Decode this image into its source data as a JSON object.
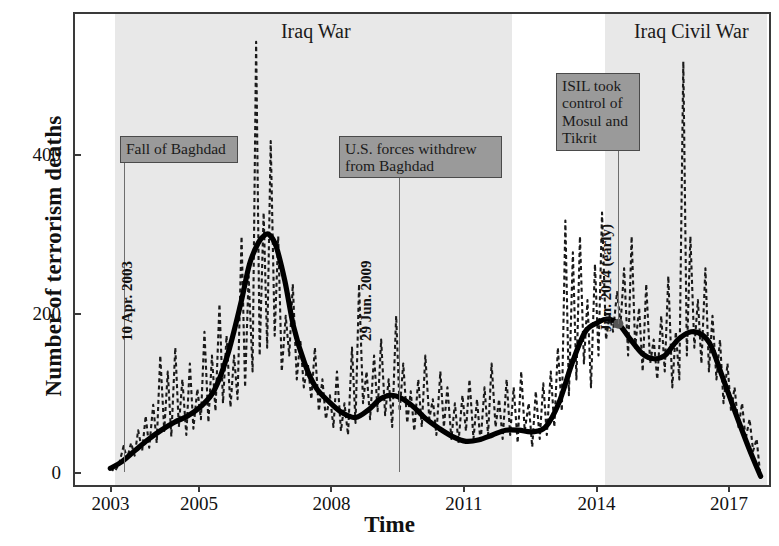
{
  "axes": {
    "ylabel": "Number of terrorism deaths",
    "xlabel": "Time",
    "yticks": [
      {
        "value": 0,
        "label": "0"
      },
      {
        "value": 200,
        "label": "200"
      },
      {
        "value": 400,
        "label": "400"
      }
    ],
    "xticks": [
      {
        "value": 2003,
        "label": "2003"
      },
      {
        "value": 2005,
        "label": "2005"
      },
      {
        "value": 2008,
        "label": "2008"
      },
      {
        "value": 2011,
        "label": "2011"
      },
      {
        "value": 2014,
        "label": "2014"
      },
      {
        "value": 2017,
        "label": "2017"
      }
    ],
    "xlim": [
      2002.15,
      2017.95
    ],
    "ylim": [
      -18,
      580
    ],
    "grid": false
  },
  "bands": [
    {
      "name": "Iraq War",
      "label": "Iraq War",
      "x_start": 2003.05,
      "x_end": 2012.05,
      "color": "#e8e8e8",
      "title_x": 2007.6
    },
    {
      "name": "Iraq Civil War",
      "label": "Iraq Civil War",
      "x_start": 2014.15,
      "x_end": 2017.82,
      "color": "#e8e8e8",
      "title_x": 2016.1
    }
  ],
  "annotations": [
    {
      "name": "fall-of-baghdad",
      "text": "Fall of Baghdad",
      "date_label": "10 Apr. 2003",
      "x": 2003.27,
      "box_left_px": 118,
      "box_top_px": 134,
      "box_width_px": 118,
      "box_height_px": 27,
      "stem_top_px": 161,
      "stem_bottom_px": 470,
      "date_x_px": 134,
      "date_y_px": 322
    },
    {
      "name": "us-forces-withdrew",
      "text": "U.S. forces withdrew\nfrom Baghdad",
      "date_label": "29 Jun. 2009",
      "x": 2009.49,
      "box_left_px": 337,
      "box_top_px": 134,
      "box_width_px": 163,
      "box_height_px": 42,
      "stem_top_px": 176,
      "stem_bottom_px": 470,
      "date_x_px": 373,
      "date_y_px": 322
    },
    {
      "name": "isil-took-control",
      "text": "ISIL took\ncontrol of\nMosul and\nTikrit",
      "date_label": "Jun. 2014 (early)",
      "x": 2014.45,
      "box_left_px": 554,
      "box_top_px": 71,
      "box_width_px": 84,
      "box_height_px": 78,
      "stem_top_px": 149,
      "stem_bottom_px": 322,
      "date_x_px": 613,
      "date_y_px": 313
    }
  ],
  "marker": {
    "name": "trend-highlight-point",
    "x": 2014.45,
    "y": 190,
    "color": "#555555"
  },
  "chart_data": {
    "type": "line",
    "title": "",
    "xlabel": "Time",
    "ylabel": "Number of terrorism deaths",
    "xlim": [
      2002.15,
      2017.95
    ],
    "ylim": [
      -18,
      580
    ],
    "grid": false,
    "legend": "none",
    "series": [
      {
        "name": "Monthly terrorism deaths (raw)",
        "style": "dashed",
        "color": "#1a1a1a",
        "x": [
          2002.95,
          2003.05,
          2003.15,
          2003.25,
          2003.33,
          2003.42,
          2003.5,
          2003.58,
          2003.67,
          2003.75,
          2003.83,
          2003.92,
          2004.0,
          2004.08,
          2004.17,
          2004.25,
          2004.33,
          2004.42,
          2004.5,
          2004.58,
          2004.67,
          2004.75,
          2004.83,
          2004.92,
          2005.0,
          2005.08,
          2005.17,
          2005.25,
          2005.33,
          2005.42,
          2005.5,
          2005.58,
          2005.67,
          2005.75,
          2005.83,
          2005.92,
          2006.0,
          2006.08,
          2006.17,
          2006.25,
          2006.33,
          2006.42,
          2006.5,
          2006.58,
          2006.67,
          2006.75,
          2006.83,
          2006.92,
          2007.0,
          2007.08,
          2007.17,
          2007.25,
          2007.33,
          2007.42,
          2007.5,
          2007.58,
          2007.67,
          2007.75,
          2007.83,
          2007.92,
          2008.0,
          2008.08,
          2008.17,
          2008.25,
          2008.33,
          2008.42,
          2008.5,
          2008.58,
          2008.67,
          2008.75,
          2008.83,
          2008.92,
          2009.0,
          2009.08,
          2009.17,
          2009.25,
          2009.33,
          2009.42,
          2009.5,
          2009.58,
          2009.67,
          2009.75,
          2009.83,
          2009.92,
          2010.0,
          2010.08,
          2010.17,
          2010.25,
          2010.33,
          2010.42,
          2010.5,
          2010.58,
          2010.67,
          2010.75,
          2010.83,
          2010.92,
          2011.0,
          2011.08,
          2011.17,
          2011.25,
          2011.33,
          2011.42,
          2011.5,
          2011.58,
          2011.67,
          2011.75,
          2011.83,
          2011.92,
          2012.0,
          2012.08,
          2012.17,
          2012.25,
          2012.33,
          2012.42,
          2012.5,
          2012.58,
          2012.67,
          2012.75,
          2012.83,
          2012.92,
          2013.0,
          2013.08,
          2013.17,
          2013.25,
          2013.33,
          2013.42,
          2013.5,
          2013.58,
          2013.67,
          2013.75,
          2013.83,
          2013.92,
          2014.0,
          2014.08,
          2014.17,
          2014.25,
          2014.33,
          2014.42,
          2014.5,
          2014.58,
          2014.67,
          2014.75,
          2014.83,
          2014.92,
          2015.0,
          2015.08,
          2015.17,
          2015.25,
          2015.33,
          2015.42,
          2015.5,
          2015.58,
          2015.67,
          2015.75,
          2015.83,
          2015.92,
          2016.0,
          2016.08,
          2016.17,
          2016.25,
          2016.33,
          2016.42,
          2016.5,
          2016.58,
          2016.67,
          2016.75,
          2016.83,
          2016.92,
          2017.0,
          2017.08,
          2017.17,
          2017.25,
          2017.33,
          2017.42,
          2017.5,
          2017.58,
          2017.67
        ],
        "y": [
          8,
          4,
          14,
          36,
          20,
          40,
          24,
          56,
          30,
          74,
          34,
          88,
          40,
          150,
          55,
          130,
          48,
          160,
          60,
          120,
          50,
          140,
          58,
          108,
          70,
          180,
          66,
          150,
          80,
          215,
          90,
          175,
          85,
          150,
          95,
          300,
          110,
          250,
          130,
          545,
          150,
          330,
          160,
          420,
          175,
          300,
          130,
          200,
          150,
          240,
          120,
          170,
          110,
          140,
          95,
          160,
          80,
          120,
          70,
          100,
          60,
          130,
          55,
          90,
          50,
          160,
          65,
          240,
          90,
          130,
          70,
          150,
          80,
          170,
          75,
          120,
          60,
          200,
          80,
          140,
          65,
          105,
          55,
          120,
          60,
          150,
          70,
          95,
          50,
          130,
          60,
          110,
          45,
          90,
          40,
          100,
          55,
          120,
          45,
          95,
          40,
          110,
          50,
          140,
          60,
          95,
          45,
          120,
          50,
          110,
          40,
          130,
          55,
          90,
          35,
          105,
          45,
          115,
          50,
          130,
          60,
          160,
          80,
          320,
          100,
          280,
          120,
          300,
          140,
          220,
          110,
          265,
          150,
          330,
          170,
          200,
          180,
          230,
          190,
          260,
          150,
          300,
          160,
          210,
          130,
          240,
          140,
          170,
          120,
          200,
          130,
          250,
          110,
          180,
          120,
          520,
          150,
          300,
          160,
          220,
          140,
          260,
          130,
          200,
          120,
          170,
          90,
          140,
          80,
          110,
          60,
          90,
          45,
          70,
          30,
          45,
          -5
        ]
      },
      {
        "name": "Smoothed trend",
        "style": "solid",
        "color": "#000000",
        "x": [
          2002.95,
          2003.2,
          2003.5,
          2003.8,
          2004.1,
          2004.4,
          2004.7,
          2005.0,
          2005.3,
          2005.6,
          2005.9,
          2006.1,
          2006.3,
          2006.45,
          2006.55,
          2006.7,
          2006.9,
          2007.1,
          2007.35,
          2007.6,
          2007.9,
          2008.2,
          2008.5,
          2008.8,
          2009.05,
          2009.3,
          2009.55,
          2009.8,
          2010.1,
          2010.4,
          2010.7,
          2011.0,
          2011.3,
          2011.6,
          2011.9,
          2012.2,
          2012.5,
          2012.8,
          2013.1,
          2013.4,
          2013.7,
          2014.0,
          2014.2,
          2014.45,
          2014.7,
          2015.0,
          2015.25,
          2015.5,
          2015.8,
          2016.1,
          2016.35,
          2016.55,
          2016.8,
          2017.1,
          2017.4,
          2017.67
        ],
        "y": [
          8,
          16,
          30,
          44,
          56,
          66,
          74,
          86,
          106,
          150,
          215,
          265,
          292,
          302,
          302,
          288,
          244,
          186,
          140,
          110,
          92,
          78,
          72,
          82,
          95,
          100,
          96,
          86,
          70,
          58,
          48,
          42,
          44,
          50,
          56,
          56,
          54,
          60,
          90,
          140,
          180,
          192,
          196,
          190,
          172,
          152,
          146,
          150,
          170,
          180,
          176,
          162,
          124,
          78,
          34,
          -2
        ]
      }
    ],
    "shaded_periods": [
      {
        "label": "Iraq War",
        "start": 2003.05,
        "end": 2012.05
      },
      {
        "label": "Iraq Civil War",
        "start": 2014.15,
        "end": 2017.82
      }
    ],
    "event_annotations": [
      {
        "label": "Fall of Baghdad",
        "date": "10 Apr. 2003",
        "x": 2003.27
      },
      {
        "label": "U.S. forces withdrew from Baghdad",
        "date": "29 Jun. 2009",
        "x": 2009.49
      },
      {
        "label": "ISIL took control of Mosul and Tikrit",
        "date": "Jun. 2014 (early)",
        "x": 2014.45
      }
    ]
  }
}
